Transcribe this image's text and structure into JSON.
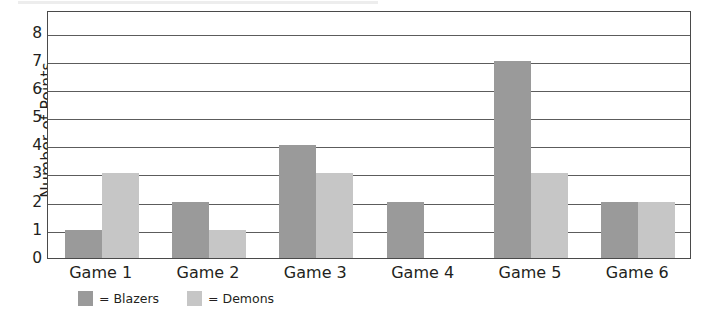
{
  "chart_data": {
    "type": "bar",
    "title": "",
    "xlabel": "",
    "ylabel": "Number of Points",
    "ylim": [
      0,
      8.8
    ],
    "y_ticks": [
      0,
      1,
      2,
      3,
      4,
      5,
      6,
      7,
      8
    ],
    "grid": true,
    "legend_position": "below-axis-left",
    "categories": [
      "Game 1",
      "Game 2",
      "Game 3",
      "Game 4",
      "Game 5",
      "Game 6"
    ],
    "series": [
      {
        "name": "Blazers",
        "color": "#9a9a9a",
        "legend_label": "= Blazers",
        "values": [
          1,
          2,
          4,
          2,
          7,
          2
        ]
      },
      {
        "name": "Demons",
        "color": "#c6c6c6",
        "legend_label": "= Demons",
        "values": [
          3,
          1,
          3,
          0,
          3,
          2
        ]
      }
    ]
  },
  "axis": {
    "y_title": "Number of Points"
  }
}
